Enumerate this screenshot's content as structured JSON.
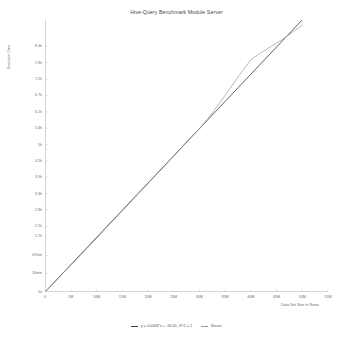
{
  "chart_data": {
    "type": "line",
    "title": "Hive-Query Benchmark Module Server",
    "xlabel": "Data Set Size in Rows",
    "ylabel": "Execution Time",
    "grid": false,
    "legend_position": "bottom",
    "xlim": [
      0,
      55000000
    ],
    "ylim": [
      0,
      29880
    ],
    "xticks": [
      0,
      5000000,
      10000000,
      15000000,
      20000000,
      25000000,
      30000000,
      35000000,
      40000000,
      45000000,
      50000000,
      55000000
    ],
    "xticklabels": [
      "0",
      "5M",
      "10M",
      "15M",
      "20M",
      "25M",
      "30M",
      "35M",
      "40M",
      "45M",
      "50M",
      "55M"
    ],
    "yticks": [
      0,
      2040,
      4020,
      6120,
      7200,
      9000,
      10800,
      12600,
      14400,
      16200,
      18000,
      19800,
      21600,
      23400,
      25200,
      27000,
      28800
    ],
    "yticklabels": [
      "0s",
      "34min",
      "67min",
      "1.7h",
      "2.2h",
      "2.8h",
      "3.3h",
      "3.9h",
      "4.5h",
      "5h",
      "5.6h",
      "6.1h",
      "6.7h",
      "7.2h",
      "7.8h",
      "8.3h"
    ],
    "series": [
      {
        "name": "y = 0.0006*x + -94.61, R^2 = 1",
        "type": "trendline",
        "color": "#3a3a3a",
        "x": [
          0,
          50000000
        ],
        "values": [
          0,
          29900
        ]
      },
      {
        "name": "Server",
        "type": "measured",
        "color": "#9a9a9a",
        "x": [
          0,
          2500000,
          5000000,
          7500000,
          10000000,
          12500000,
          15000000,
          17500000,
          20000000,
          22500000,
          25000000,
          27500000,
          29000000,
          30000000,
          32000000,
          34000000,
          36000000,
          38000000,
          40000000,
          42000000,
          44000000,
          46000000,
          48000000,
          50000000
        ],
        "values": [
          0,
          1450,
          2950,
          4400,
          5900,
          7400,
          8900,
          10400,
          11900,
          13400,
          14900,
          16500,
          17400,
          17900,
          19300,
          20800,
          22400,
          24000,
          25500,
          26300,
          27000,
          27700,
          28500,
          29300
        ]
      }
    ],
    "annotations": []
  },
  "legend": {
    "items": [
      {
        "label": "y = 0.0006*x + -94.61, R^2 = 1",
        "color": "#3a3a3a"
      },
      {
        "label": "Server",
        "color": "#9a9a9a"
      }
    ]
  }
}
